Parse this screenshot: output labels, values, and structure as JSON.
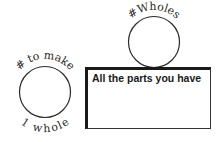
{
  "diagram": {
    "left_circle": {
      "top_label": "# to make",
      "bottom_label": "1 whole"
    },
    "top_circle": {
      "top_label": "#Wholes"
    },
    "box": {
      "label": "All the parts you have"
    },
    "colors": {
      "stroke": "#2a2a2a",
      "background": "#ffffff"
    }
  }
}
